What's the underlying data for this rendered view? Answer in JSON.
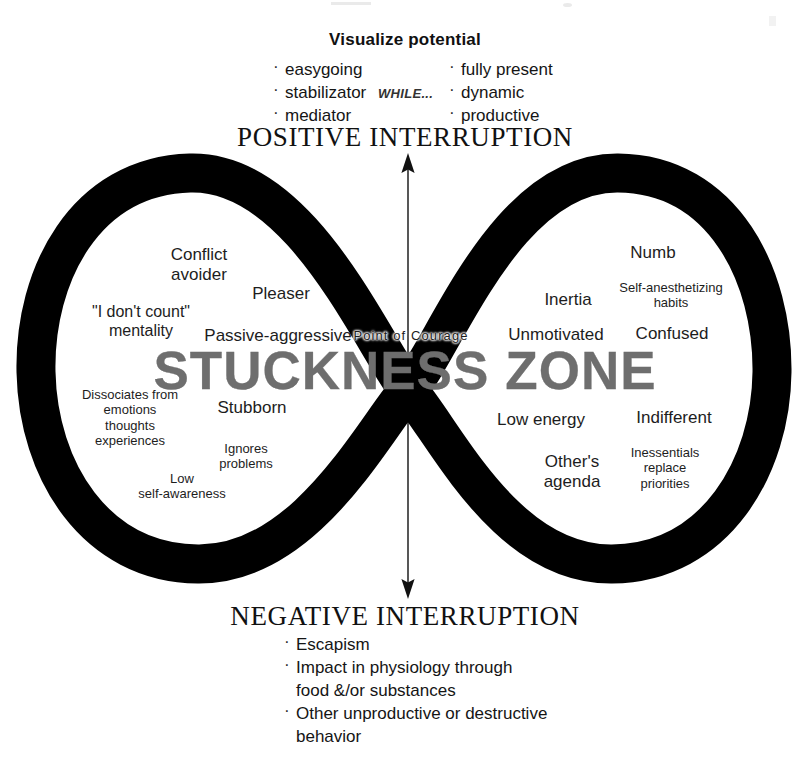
{
  "diagram": {
    "title_top": "Visualize potential",
    "while_label": "WHILE...",
    "positive_heading": "POSITIVE INTERRUPTION",
    "negative_heading": "NEGATIVE INTERRUPTION",
    "center_label": "Point of Courage",
    "watermark": "STUCKNESS ZONE",
    "watermark_color": "#6e6e6e",
    "loop_color": "#000000",
    "background_color": "#ffffff",
    "arrow_up_name": "positive-interruption-arrow",
    "arrow_down_name": "negative-interruption-arrow"
  },
  "visualize": {
    "left_items": [
      "easygoing",
      "stabilizator",
      "mediator"
    ],
    "right_items": [
      "fully present",
      "dynamic",
      "productive"
    ]
  },
  "negative": {
    "items": [
      "Escapism",
      "Impact in physiology through",
      "food &/or substances",
      "Other unproductive or destructive",
      "behavior"
    ]
  },
  "left_lobe": {
    "label": "Stuckness left lobe",
    "words": [
      "Conflict\navoider",
      "Pleaser",
      "\"I don't count\"\nmentality",
      "Passive-aggressive",
      "Dissociates from\nemotions\nthoughts\nexperiences",
      "Stubborn",
      "Ignores\nproblems",
      "Low\nself-awareness"
    ]
  },
  "right_lobe": {
    "label": "Stuckness right lobe",
    "words": [
      "Numb",
      "Self-anesthetizing\nhabits",
      "Inertia",
      "Unmotivated",
      "Confused",
      "Low energy",
      "Indifferent",
      "Other's\nagenda",
      "Inessentials\nreplace\npriorities"
    ]
  }
}
